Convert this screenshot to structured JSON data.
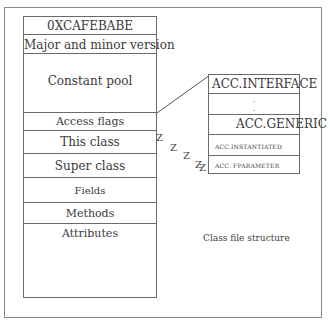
{
  "diagram": {
    "caption": "Class file structure",
    "stack": [
      {
        "label": "0XCAFEBABE"
      },
      {
        "label": "Major and minor version"
      },
      {
        "label": "Constant pool"
      },
      {
        "label": "Access flags"
      },
      {
        "label": "This class"
      },
      {
        "label": "Super class"
      },
      {
        "label": "Fields"
      },
      {
        "label": "Methods"
      },
      {
        "label": "Attributes"
      }
    ],
    "access_flags_box": [
      {
        "label": "ACC.INTERFACE"
      },
      {
        "label": "."
      },
      {
        "label": "ACC.GENERIC"
      },
      {
        "label": "ACC.INSTANTIATED"
      },
      {
        "label": "ACC. FPARAMETER"
      }
    ],
    "zigzag": [
      "Z",
      "Z",
      "Z",
      "Z",
      "Z"
    ]
  }
}
